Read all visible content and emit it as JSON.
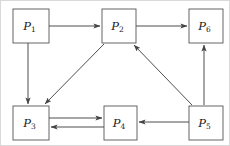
{
  "figure": {
    "type": "directed-graph",
    "width": 230,
    "height": 146,
    "background_color": "#ffffff",
    "border_color": "#d9d9d9",
    "node_stroke_color": "#555555",
    "edge_color": "#444444",
    "label_color": "#1a1a1a"
  },
  "nodes": [
    {
      "id": "P1",
      "base": "P",
      "sub": "1",
      "label": "P1",
      "x": 12,
      "y": 8,
      "w": 36,
      "h": 34
    },
    {
      "id": "P2",
      "base": "P",
      "sub": "2",
      "label": "P2",
      "x": 101,
      "y": 8,
      "w": 34,
      "h": 34
    },
    {
      "id": "P6",
      "base": "P",
      "sub": "6",
      "label": "P6",
      "x": 188,
      "y": 8,
      "w": 34,
      "h": 34
    },
    {
      "id": "P3",
      "base": "P",
      "sub": "3",
      "label": "P3",
      "x": 12,
      "y": 105,
      "w": 36,
      "h": 34
    },
    {
      "id": "P4",
      "base": "P",
      "sub": "4",
      "label": "P4",
      "x": 103,
      "y": 105,
      "w": 33,
      "h": 34
    },
    {
      "id": "P5",
      "base": "P",
      "sub": "5",
      "label": "P5",
      "x": 188,
      "y": 105,
      "w": 34,
      "h": 34
    }
  ],
  "edges": [
    {
      "id": "e-p1-p2",
      "from": "P1",
      "to": "P2",
      "kind": "horizontal",
      "x1": 48,
      "y1": 25,
      "x2": 99,
      "y2": 25
    },
    {
      "id": "e-p2-p6",
      "from": "P2",
      "to": "P6",
      "kind": "horizontal",
      "x1": 135,
      "y1": 25,
      "x2": 186,
      "y2": 25
    },
    {
      "id": "e-p1-p3",
      "from": "P1",
      "to": "P3",
      "kind": "vertical",
      "x1": 27,
      "y1": 42,
      "x2": 27,
      "y2": 103
    },
    {
      "id": "e-p2-p3",
      "from": "P2",
      "to": "P3",
      "kind": "diagonal",
      "x1": 103,
      "y1": 43,
      "x2": 44,
      "y2": 103
    },
    {
      "id": "e-p5-p2",
      "from": "P5",
      "to": "P2",
      "kind": "diagonal",
      "x1": 191,
      "y1": 104,
      "x2": 133,
      "y2": 44
    },
    {
      "id": "e-p5-p6",
      "from": "P5",
      "to": "P6",
      "kind": "vertical",
      "x1": 203,
      "y1": 104,
      "x2": 203,
      "y2": 44
    },
    {
      "id": "e-p3-p4",
      "from": "P3",
      "to": "P4",
      "kind": "horizontal",
      "x1": 48,
      "y1": 117,
      "x2": 101,
      "y2": 117
    },
    {
      "id": "e-p4-p3",
      "from": "P4",
      "to": "P3",
      "kind": "horizontal",
      "x1": 103,
      "y1": 126,
      "x2": 50,
      "y2": 126
    },
    {
      "id": "e-p5-p4",
      "from": "P5",
      "to": "P4",
      "kind": "horizontal",
      "x1": 188,
      "y1": 121,
      "x2": 138,
      "y2": 121
    }
  ]
}
